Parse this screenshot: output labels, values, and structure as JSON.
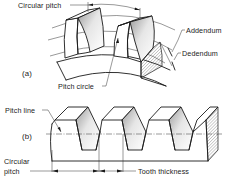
{
  "figure": {
    "part_a": {
      "label": "(a)",
      "annotations": {
        "circular_pitch": "Circular pitch",
        "addendum": "Addendum",
        "dedendum": "Dedendum",
        "pitch_circle": "Pitch circle"
      }
    },
    "part_b": {
      "label": "(b)",
      "annotations": {
        "pitch_line": "Pitch line",
        "circular_pitch_line1": "Circular",
        "circular_pitch_line2": "pitch",
        "tooth_thickness": "Tooth thickness"
      }
    },
    "colors": {
      "line": "#1a1a1a",
      "shade_light": "#ffffff",
      "shade_dark": "#c8c8c8",
      "background": "#ffffff"
    }
  }
}
